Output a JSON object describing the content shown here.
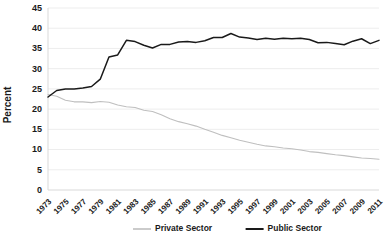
{
  "chart_data": {
    "type": "line",
    "title": "",
    "xlabel": "",
    "ylabel": "Percent",
    "ylim": [
      0,
      45
    ],
    "ytick_step": 5,
    "yticks": [
      "0",
      "5",
      "10",
      "15",
      "20",
      "25",
      "30",
      "35",
      "40",
      "45"
    ],
    "grid": true,
    "legend_position": "bottom",
    "x": [
      1973,
      1974,
      1975,
      1976,
      1977,
      1978,
      1979,
      1980,
      1981,
      1982,
      1983,
      1984,
      1985,
      1986,
      1987,
      1988,
      1989,
      1990,
      1991,
      1992,
      1993,
      1994,
      1995,
      1996,
      1997,
      1998,
      1999,
      2000,
      2001,
      2002,
      2003,
      2004,
      2005,
      2006,
      2007,
      2008,
      2009,
      2010,
      2011
    ],
    "xtick_labels": [
      "1973",
      "1975",
      "1977",
      "1979",
      "1981",
      "1983",
      "1985",
      "1987",
      "1989",
      "1991",
      "1993",
      "1995",
      "1997",
      "1999",
      "2001",
      "2003",
      "2005",
      "2007",
      "2009",
      "2011"
    ],
    "xtick_values": [
      1973,
      1975,
      1977,
      1979,
      1981,
      1983,
      1985,
      1987,
      1989,
      1991,
      1993,
      1995,
      1997,
      1999,
      2001,
      2003,
      2005,
      2007,
      2009,
      2011
    ],
    "series": [
      {
        "name": "Private Sector",
        "color": "#bfbfbf",
        "values": [
          23.6,
          23.2,
          22.2,
          21.8,
          21.8,
          21.6,
          21.9,
          21.7,
          21.0,
          20.6,
          20.4,
          19.7,
          19.4,
          18.6,
          17.6,
          16.9,
          16.4,
          15.8,
          15.0,
          14.3,
          13.5,
          12.9,
          12.3,
          11.8,
          11.3,
          10.9,
          10.7,
          10.4,
          10.2,
          9.9,
          9.5,
          9.3,
          9.0,
          8.7,
          8.5,
          8.2,
          7.9,
          7.8,
          7.6
        ]
      },
      {
        "name": "Public Sector",
        "color": "#1a1a1a",
        "values": [
          23.0,
          24.6,
          25.0,
          25.0,
          25.2,
          25.6,
          27.4,
          32.9,
          33.4,
          37.0,
          36.7,
          35.8,
          35.1,
          36.0,
          36.0,
          36.6,
          36.7,
          36.5,
          36.9,
          37.7,
          37.7,
          38.7,
          37.8,
          37.6,
          37.2,
          37.5,
          37.3,
          37.5,
          37.4,
          37.5,
          37.2,
          36.4,
          36.5,
          36.2,
          35.9,
          36.8,
          37.4,
          36.2,
          37.0
        ]
      }
    ]
  }
}
